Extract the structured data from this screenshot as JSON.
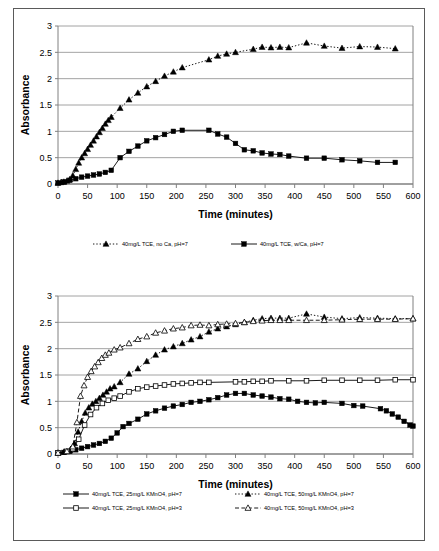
{
  "page": {
    "border_color": "#5a5a5a",
    "background": "#ffffff"
  },
  "charts": [
    {
      "id": "chart-top",
      "name": "absorbance-vs-time-calcium",
      "xlabel": "Time (minutes)",
      "ylabel": "Absorbance",
      "xticks": [
        0,
        50,
        100,
        150,
        200,
        250,
        300,
        350,
        400,
        450,
        500,
        550,
        600
      ],
      "yticks": [
        0,
        0.5,
        1,
        1.5,
        2,
        2.5,
        3
      ],
      "legend": [
        {
          "label": "40mg/L TCE, no Ca, pH=7",
          "marker": "triangle-filled",
          "line": "dotted"
        },
        {
          "label": "40mg/L TCE, w/Ca, pH=7",
          "marker": "square-filled",
          "line": "solid"
        }
      ]
    },
    {
      "id": "chart-bottom",
      "name": "absorbance-vs-time-permanganate",
      "xlabel": "Time (minutes)",
      "ylabel": "Absorbance",
      "xticks": [
        0,
        50,
        100,
        150,
        200,
        250,
        300,
        350,
        400,
        450,
        500,
        550,
        600
      ],
      "yticks": [
        0,
        0.5,
        1,
        1.5,
        2,
        2.5,
        3
      ],
      "legend": [
        {
          "label": "40mg/L TCE, 25mg/L KMnO4, pH=7",
          "marker": "square-filled",
          "line": "solid"
        },
        {
          "label": "40mg/L TCE, 50mg/L KMnO4, pH=7",
          "marker": "triangle-filled",
          "line": "dotted"
        },
        {
          "label": "40mg/L TCE, 25mg/L KMnO4, pH=3",
          "marker": "square-open",
          "line": "solid"
        },
        {
          "label": "40mg/L TCE, 50mg/L KMnO4, pH=3",
          "marker": "triangle-open",
          "line": "dashed"
        }
      ]
    }
  ],
  "chart_data": [
    {
      "type": "line",
      "title": "",
      "xlabel": "Time (minutes)",
      "ylabel": "Absorbance",
      "xlim": [
        0,
        600
      ],
      "ylim": [
        0,
        3
      ],
      "xticks": [
        0,
        50,
        100,
        150,
        200,
        250,
        300,
        350,
        400,
        450,
        500,
        550,
        600
      ],
      "yticks": [
        0,
        0.5,
        1,
        1.5,
        2,
        2.5,
        3
      ],
      "grid": "horizontal",
      "legend_position": "below",
      "series": [
        {
          "name": "40mg/L TCE, no Ca, pH=7",
          "marker": "triangle-filled",
          "line": "dotted",
          "points": [
            [
              0,
              0.02
            ],
            [
              5,
              0.03
            ],
            [
              10,
              0.04
            ],
            [
              15,
              0.06
            ],
            [
              20,
              0.09
            ],
            [
              25,
              0.16
            ],
            [
              30,
              0.28
            ],
            [
              35,
              0.4
            ],
            [
              40,
              0.5
            ],
            [
              45,
              0.58
            ],
            [
              50,
              0.66
            ],
            [
              55,
              0.74
            ],
            [
              60,
              0.82
            ],
            [
              65,
              0.9
            ],
            [
              70,
              0.98
            ],
            [
              75,
              1.06
            ],
            [
              80,
              1.14
            ],
            [
              85,
              1.21
            ],
            [
              90,
              1.27
            ],
            [
              105,
              1.44
            ],
            [
              120,
              1.6
            ],
            [
              135,
              1.73
            ],
            [
              150,
              1.85
            ],
            [
              165,
              1.95
            ],
            [
              180,
              2.05
            ],
            [
              195,
              2.13
            ],
            [
              210,
              2.21
            ],
            [
              255,
              2.36
            ],
            [
              270,
              2.43
            ],
            [
              285,
              2.47
            ],
            [
              300,
              2.5
            ],
            [
              330,
              2.56
            ],
            [
              345,
              2.6
            ],
            [
              360,
              2.59
            ],
            [
              375,
              2.6
            ],
            [
              390,
              2.59
            ],
            [
              420,
              2.68
            ],
            [
              450,
              2.62
            ],
            [
              480,
              2.58
            ],
            [
              510,
              2.61
            ],
            [
              540,
              2.6
            ],
            [
              570,
              2.57
            ]
          ]
        },
        {
          "name": "40mg/L TCE, w/Ca, pH=7",
          "marker": "square-filled",
          "line": "solid",
          "points": [
            [
              0,
              0.02
            ],
            [
              10,
              0.04
            ],
            [
              20,
              0.07
            ],
            [
              30,
              0.1
            ],
            [
              40,
              0.13
            ],
            [
              50,
              0.15
            ],
            [
              60,
              0.17
            ],
            [
              70,
              0.19
            ],
            [
              80,
              0.22
            ],
            [
              90,
              0.26
            ],
            [
              105,
              0.5
            ],
            [
              120,
              0.62
            ],
            [
              135,
              0.72
            ],
            [
              150,
              0.82
            ],
            [
              165,
              0.88
            ],
            [
              180,
              0.94
            ],
            [
              195,
              1.0
            ],
            [
              210,
              1.02
            ],
            [
              255,
              1.02
            ],
            [
              270,
              0.95
            ],
            [
              285,
              0.89
            ],
            [
              300,
              0.77
            ],
            [
              315,
              0.65
            ],
            [
              330,
              0.63
            ],
            [
              345,
              0.59
            ],
            [
              360,
              0.57
            ],
            [
              375,
              0.56
            ],
            [
              390,
              0.53
            ],
            [
              420,
              0.49
            ],
            [
              450,
              0.49
            ],
            [
              480,
              0.46
            ],
            [
              510,
              0.44
            ],
            [
              540,
              0.41
            ],
            [
              570,
              0.41
            ]
          ]
        }
      ]
    },
    {
      "type": "line",
      "title": "",
      "xlabel": "Time (minutes)",
      "ylabel": "Absorbance",
      "xlim": [
        0,
        600
      ],
      "ylim": [
        0,
        3
      ],
      "xticks": [
        0,
        50,
        100,
        150,
        200,
        250,
        300,
        350,
        400,
        450,
        500,
        550,
        600
      ],
      "yticks": [
        0,
        0.5,
        1,
        1.5,
        2,
        2.5,
        3
      ],
      "grid": "horizontal",
      "legend_position": "below",
      "series": [
        {
          "name": "40mg/L TCE, 25mg/L KMnO4, pH=7",
          "marker": "square-filled",
          "line": "solid",
          "points": [
            [
              0,
              0.02
            ],
            [
              10,
              0.03
            ],
            [
              20,
              0.05
            ],
            [
              30,
              0.08
            ],
            [
              40,
              0.11
            ],
            [
              50,
              0.14
            ],
            [
              60,
              0.17
            ],
            [
              70,
              0.2
            ],
            [
              80,
              0.24
            ],
            [
              90,
              0.3
            ],
            [
              100,
              0.4
            ],
            [
              110,
              0.52
            ],
            [
              120,
              0.58
            ],
            [
              135,
              0.66
            ],
            [
              150,
              0.76
            ],
            [
              165,
              0.82
            ],
            [
              180,
              0.87
            ],
            [
              195,
              0.91
            ],
            [
              210,
              0.94
            ],
            [
              225,
              0.98
            ],
            [
              240,
              1.0
            ],
            [
              255,
              1.03
            ],
            [
              270,
              1.07
            ],
            [
              285,
              1.12
            ],
            [
              300,
              1.15
            ],
            [
              315,
              1.15
            ],
            [
              330,
              1.12
            ],
            [
              345,
              1.1
            ],
            [
              360,
              1.08
            ],
            [
              375,
              1.05
            ],
            [
              390,
              1.04
            ],
            [
              405,
              1.0
            ],
            [
              420,
              0.98
            ],
            [
              435,
              0.97
            ],
            [
              450,
              0.98
            ],
            [
              480,
              0.96
            ],
            [
              500,
              0.92
            ],
            [
              515,
              0.91
            ],
            [
              545,
              0.86
            ],
            [
              555,
              0.82
            ],
            [
              565,
              0.76
            ],
            [
              575,
              0.7
            ],
            [
              585,
              0.62
            ],
            [
              595,
              0.55
            ],
            [
              600,
              0.53
            ]
          ]
        },
        {
          "name": "40mg/L TCE, 50mg/L KMnO4, pH=7",
          "marker": "triangle-filled",
          "line": "dotted",
          "points": [
            [
              0,
              0.02
            ],
            [
              10,
              0.04
            ],
            [
              20,
              0.07
            ],
            [
              28,
              0.2
            ],
            [
              34,
              0.42
            ],
            [
              40,
              0.62
            ],
            [
              46,
              0.78
            ],
            [
              52,
              0.88
            ],
            [
              58,
              0.95
            ],
            [
              64,
              1.0
            ],
            [
              70,
              1.06
            ],
            [
              76,
              1.12
            ],
            [
              82,
              1.18
            ],
            [
              88,
              1.24
            ],
            [
              95,
              1.28
            ],
            [
              105,
              1.36
            ],
            [
              120,
              1.52
            ],
            [
              135,
              1.62
            ],
            [
              150,
              1.76
            ],
            [
              165,
              1.88
            ],
            [
              180,
              1.98
            ],
            [
              195,
              2.04
            ],
            [
              210,
              2.1
            ],
            [
              225,
              2.17
            ],
            [
              240,
              2.23
            ],
            [
              255,
              2.32
            ],
            [
              270,
              2.38
            ],
            [
              285,
              2.42
            ],
            [
              300,
              2.46
            ],
            [
              315,
              2.5
            ],
            [
              330,
              2.54
            ],
            [
              345,
              2.57
            ],
            [
              360,
              2.58
            ],
            [
              375,
              2.58
            ],
            [
              390,
              2.58
            ],
            [
              420,
              2.66
            ],
            [
              450,
              2.6
            ],
            [
              480,
              2.57
            ],
            [
              510,
              2.59
            ],
            [
              540,
              2.58
            ],
            [
              570,
              2.57
            ],
            [
              600,
              2.57
            ]
          ]
        },
        {
          "name": "40mg/L TCE, 25mg/L KMnO4, pH=3",
          "marker": "square-open",
          "line": "solid",
          "points": [
            [
              0,
              0.02
            ],
            [
              15,
              0.05
            ],
            [
              25,
              0.1
            ],
            [
              35,
              0.28
            ],
            [
              45,
              0.55
            ],
            [
              55,
              0.75
            ],
            [
              65,
              0.88
            ],
            [
              75,
              0.96
            ],
            [
              85,
              1.02
            ],
            [
              95,
              1.06
            ],
            [
              105,
              1.1
            ],
            [
              120,
              1.18
            ],
            [
              135,
              1.24
            ],
            [
              150,
              1.27
            ],
            [
              165,
              1.29
            ],
            [
              180,
              1.31
            ],
            [
              195,
              1.33
            ],
            [
              210,
              1.34
            ],
            [
              225,
              1.35
            ],
            [
              240,
              1.36
            ],
            [
              255,
              1.36
            ],
            [
              300,
              1.37
            ],
            [
              315,
              1.37
            ],
            [
              330,
              1.38
            ],
            [
              345,
              1.38
            ],
            [
              360,
              1.39
            ],
            [
              390,
              1.39
            ],
            [
              420,
              1.39
            ],
            [
              450,
              1.4
            ],
            [
              480,
              1.4
            ],
            [
              510,
              1.4
            ],
            [
              540,
              1.4
            ],
            [
              570,
              1.41
            ],
            [
              600,
              1.41
            ]
          ]
        },
        {
          "name": "40mg/L TCE, 50mg/L KMnO4, pH=3",
          "marker": "triangle-open",
          "line": "dashed",
          "points": [
            [
              0,
              0.02
            ],
            [
              15,
              0.05
            ],
            [
              25,
              0.14
            ],
            [
              32,
              0.6
            ],
            [
              38,
              1.1
            ],
            [
              44,
              1.3
            ],
            [
              50,
              1.46
            ],
            [
              56,
              1.57
            ],
            [
              62,
              1.66
            ],
            [
              68,
              1.74
            ],
            [
              74,
              1.82
            ],
            [
              80,
              1.88
            ],
            [
              86,
              1.92
            ],
            [
              95,
              1.98
            ],
            [
              105,
              2.02
            ],
            [
              120,
              2.1
            ],
            [
              135,
              2.18
            ],
            [
              150,
              2.23
            ],
            [
              165,
              2.3
            ],
            [
              180,
              2.34
            ],
            [
              195,
              2.38
            ],
            [
              210,
              2.4
            ],
            [
              225,
              2.44
            ],
            [
              240,
              2.45
            ],
            [
              255,
              2.44
            ],
            [
              270,
              2.46
            ],
            [
              285,
              2.47
            ],
            [
              300,
              2.48
            ],
            [
              315,
              2.5
            ],
            [
              330,
              2.52
            ],
            [
              345,
              2.53
            ],
            [
              360,
              2.54
            ],
            [
              375,
              2.54
            ],
            [
              390,
              2.54
            ],
            [
              420,
              2.54
            ],
            [
              450,
              2.54
            ],
            [
              480,
              2.55
            ],
            [
              510,
              2.56
            ],
            [
              540,
              2.56
            ],
            [
              570,
              2.56
            ],
            [
              600,
              2.57
            ]
          ]
        }
      ]
    }
  ]
}
